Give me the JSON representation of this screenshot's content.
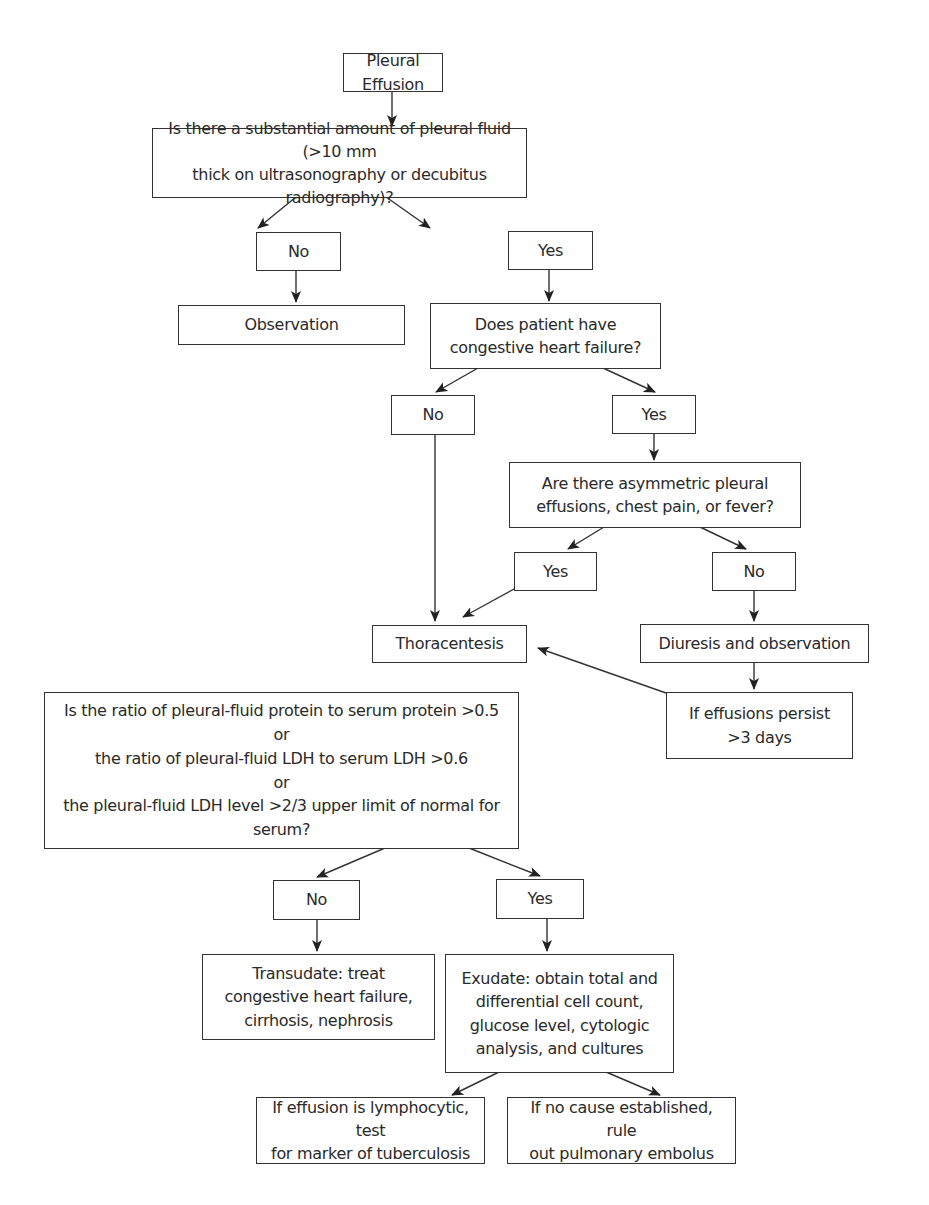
{
  "diagram": {
    "title": "Pleural Effusion",
    "nodes": {
      "start": "Pleural Effusion",
      "q_fluid_amount": "Is there a substantial amount of pleural fluid (>10 mm\nthick on ultrasonography or decubitus radiography)?",
      "no_1": "No",
      "yes_1": "Yes",
      "observation": "Observation",
      "q_chf": "Does patient have\ncongestive heart failure?",
      "no_2": "No",
      "yes_2": "Yes",
      "q_asymmetric": "Are there asymmetric pleural\neffusions, chest pain, or fever?",
      "yes_3": "Yes",
      "no_3": "No",
      "thoracentesis": "Thoracentesis",
      "diuresis": "Diuresis and observation",
      "persist": "If effusions persist\n>3 days",
      "q_ratio": "Is the ratio of pleural-fluid protein to serum protein >0.5\nor\nthe ratio of pleural-fluid LDH to serum LDH >0.6\nor\nthe pleural-fluid LDH level >2/3 upper limit of normal for serum?",
      "no_4": "No",
      "yes_4": "Yes",
      "transudate": "Transudate: treat\ncongestive heart failure,\ncirrhosis, nephrosis",
      "exudate": "Exudate: obtain total and\ndifferential cell count,\nglucose level, cytologic\nanalysis, and cultures",
      "lymphocytic": "If effusion is lymphocytic, test\nfor marker of tuberculosis",
      "no_cause": "If no cause established, rule\nout pulmonary embolus"
    },
    "edges": [
      [
        "start",
        "q_fluid_amount"
      ],
      [
        "q_fluid_amount",
        "no_1"
      ],
      [
        "q_fluid_amount",
        "yes_1"
      ],
      [
        "no_1",
        "observation"
      ],
      [
        "yes_1",
        "q_chf"
      ],
      [
        "q_chf",
        "no_2"
      ],
      [
        "q_chf",
        "yes_2"
      ],
      [
        "no_2",
        "thoracentesis"
      ],
      [
        "yes_2",
        "q_asymmetric"
      ],
      [
        "q_asymmetric",
        "yes_3"
      ],
      [
        "q_asymmetric",
        "no_3"
      ],
      [
        "yes_3",
        "thoracentesis"
      ],
      [
        "no_3",
        "diuresis"
      ],
      [
        "diuresis",
        "persist"
      ],
      [
        "persist",
        "thoracentesis"
      ],
      [
        "q_ratio",
        "no_4"
      ],
      [
        "q_ratio",
        "yes_4"
      ],
      [
        "no_4",
        "transudate"
      ],
      [
        "yes_4",
        "exudate"
      ],
      [
        "exudate",
        "lymphocytic"
      ],
      [
        "exudate",
        "no_cause"
      ]
    ],
    "colors": {
      "line": "#333333",
      "text": "#2a2a2a",
      "background": "#ffffff"
    }
  }
}
